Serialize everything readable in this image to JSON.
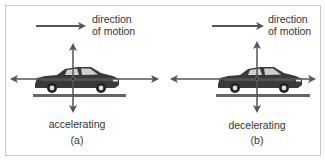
{
  "figure": {
    "panels": [
      {
        "id": "a",
        "direction_label_line1": "direction",
        "direction_label_line2": "of motion",
        "state_label": "accelerating",
        "panel_label": "(a)"
      },
      {
        "id": "b",
        "direction_label_line1": "direction",
        "direction_label_line2": "of motion",
        "state_label": "decelerating",
        "panel_label": "(b)"
      }
    ],
    "colors": {
      "arrow": "#555555",
      "car_body": "#3a3a3a",
      "road": "#666666",
      "frame": "#c8c8c8",
      "text": "#333333"
    }
  }
}
